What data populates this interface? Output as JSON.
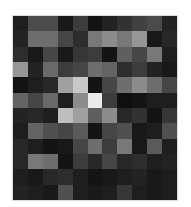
{
  "image": {
    "kind": "grayscale-pixel-grid",
    "cols": 11,
    "rows": 12,
    "background": "#ffffff",
    "pixels": [
      [
        30,
        75,
        75,
        25,
        60,
        20,
        35,
        50,
        65,
        75,
        35
      ],
      [
        35,
        110,
        110,
        70,
        45,
        120,
        140,
        120,
        150,
        25,
        40
      ],
      [
        45,
        25,
        70,
        25,
        55,
        60,
        20,
        95,
        70,
        120,
        30
      ],
      [
        150,
        35,
        105,
        60,
        70,
        110,
        100,
        45,
        60,
        35,
        25
      ],
      [
        20,
        30,
        40,
        160,
        200,
        20,
        70,
        110,
        140,
        110,
        70
      ],
      [
        100,
        70,
        105,
        30,
        140,
        235,
        60,
        15,
        20,
        30,
        30
      ],
      [
        35,
        40,
        30,
        190,
        160,
        95,
        140,
        40,
        50,
        20,
        55
      ],
      [
        30,
        100,
        80,
        70,
        90,
        20,
        70,
        80,
        25,
        30,
        80
      ],
      [
        40,
        30,
        20,
        25,
        70,
        110,
        60,
        120,
        25,
        90,
        30
      ],
      [
        40,
        120,
        110,
        20,
        60,
        40,
        70,
        40,
        45,
        30,
        35
      ],
      [
        30,
        25,
        40,
        45,
        30,
        20,
        25,
        30,
        35,
        25,
        30
      ],
      [
        35,
        30,
        25,
        80,
        30,
        25,
        30,
        55,
        30,
        25,
        30
      ]
    ]
  }
}
